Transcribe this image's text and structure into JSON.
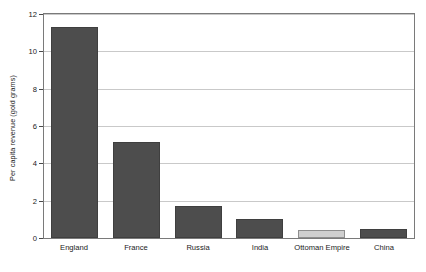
{
  "chart_data": {
    "type": "bar",
    "title": "",
    "subtitle": "",
    "xlabel": "",
    "ylabel": "Per capita revenue (gold grams)",
    "categories": [
      "England",
      "France",
      "Russia",
      "India",
      "Ottoman Empire",
      "China"
    ],
    "values": [
      11.3,
      5.15,
      1.7,
      1.0,
      0.45,
      0.5
    ],
    "bar_colors": [
      "#4d4d4d",
      "#4d4d4d",
      "#4d4d4d",
      "#4d4d4d",
      "#cfcfcf",
      "#4d4d4d"
    ],
    "ylim": [
      0,
      12
    ],
    "yticks": [
      0,
      2,
      4,
      6,
      8,
      10,
      12
    ],
    "ytick_labels": [
      "0",
      "2",
      "4",
      "6",
      "8",
      "10",
      "12"
    ],
    "grid": true,
    "grid_axis": "y",
    "legend": false,
    "legend_position": "none",
    "colors": {
      "bar_dark": "#4d4d4d",
      "bar_light": "#cfcfcf",
      "bar_dark_edge": "#3f3f3f",
      "bar_light_edge": "#8e8e8e",
      "gridline": "#c9c9c9",
      "axis": "#7a7a7a",
      "text": "#1a1a1a",
      "background": "#ffffff"
    }
  }
}
